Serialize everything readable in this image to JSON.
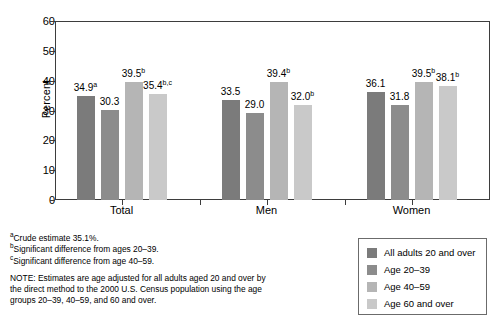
{
  "chart_data": {
    "type": "bar",
    "title": "",
    "xlabel": "",
    "ylabel": "Percent",
    "ylim": [
      0,
      60
    ],
    "yticks": [
      0,
      10,
      20,
      30,
      40,
      50,
      60
    ],
    "ytick_labels": [
      "0",
      "10",
      "20",
      "30",
      "40",
      "50",
      "60"
    ],
    "grid": false,
    "legend_position": "bottom-right",
    "categories": [
      "Total",
      "Men",
      "Women"
    ],
    "series": [
      {
        "name": "All adults 20 and over",
        "color": "#7b7b7b",
        "values": [
          34.9,
          33.5,
          36.1
        ],
        "labels": [
          "34.9",
          "33.5",
          "36.1"
        ],
        "superscripts": [
          "a",
          "",
          ""
        ]
      },
      {
        "name": "Age 20–39",
        "color": "#8c8c8c",
        "values": [
          30.3,
          29.0,
          31.8
        ],
        "labels": [
          "30.3",
          "29.0",
          "31.8"
        ],
        "superscripts": [
          "",
          "",
          ""
        ]
      },
      {
        "name": "Age 40–59",
        "color": "#b5b5b5",
        "values": [
          39.5,
          39.4,
          39.5
        ],
        "labels": [
          "39.5",
          "39.4",
          "39.5"
        ],
        "superscripts": [
          "b",
          "b",
          "b"
        ]
      },
      {
        "name": "Age 60 and over",
        "color": "#c9c9c9",
        "values": [
          35.4,
          32.0,
          38.1
        ],
        "labels": [
          "35.4",
          "32.0",
          "38.1"
        ],
        "superscripts": [
          "b,c",
          "b",
          "b"
        ]
      }
    ]
  },
  "axis": {
    "y_title": "Percent",
    "y_ticks": [
      "60",
      "50",
      "40",
      "30",
      "20",
      "10",
      "0"
    ],
    "x_labels": [
      "Total",
      "Men",
      "Women"
    ]
  },
  "legend": {
    "items": [
      {
        "label": "All adults 20 and over",
        "color": "#7b7b7b"
      },
      {
        "label": "Age 20–39",
        "color": "#8c8c8c"
      },
      {
        "label": "Age 40–59",
        "color": "#b5b5b5"
      },
      {
        "label": "Age 60 and over",
        "color": "#c9c9c9"
      }
    ]
  },
  "footnotes": [
    {
      "marker": "a",
      "text": "Crude estimate 35.1%."
    },
    {
      "marker": "b",
      "text": "Significant difference from ages 20–39."
    },
    {
      "marker": "c",
      "text": "Significant difference from age 40–59."
    }
  ],
  "note": "NOTE: Estimates are age adjusted for all adults aged 20 and over by the direct method to the 2000 U.S. Census population using the age groups 20–39, 40–59, and 60 and over."
}
